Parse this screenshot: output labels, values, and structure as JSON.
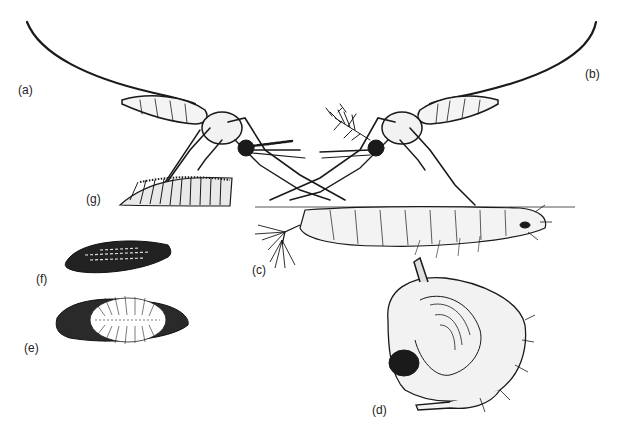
{
  "figure": {
    "labels": {
      "a": "(a)",
      "b": "(b)",
      "c": "(c)",
      "d": "(d)",
      "e": "(e)",
      "f": "(f)",
      "g": "(g)"
    },
    "colors": {
      "ink": "#1a1a1a",
      "background": "#ffffff",
      "water_line": "#555555"
    }
  }
}
